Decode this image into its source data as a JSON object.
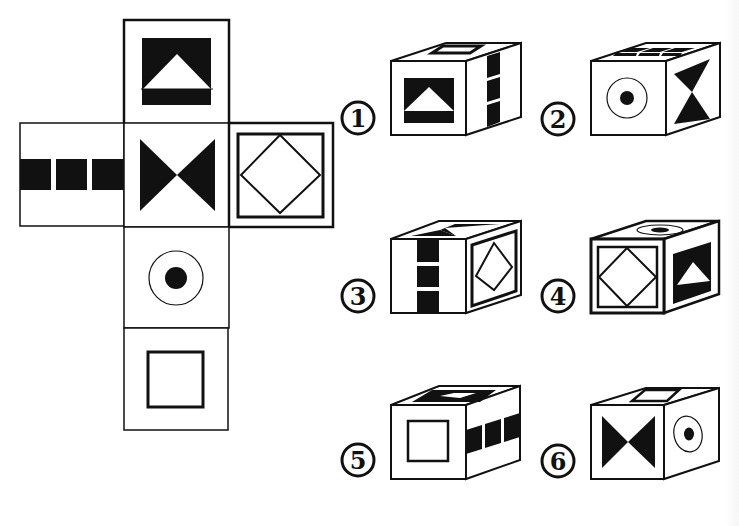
{
  "puzzle": {
    "type": "cube-net-folding",
    "net": {
      "faces": [
        {
          "id": "top",
          "symbol": "white-triangle-on-black-square",
          "position": "row0-col1"
        },
        {
          "id": "left",
          "symbol": "three-black-squares-row",
          "position": "row1-col0"
        },
        {
          "id": "center",
          "symbol": "black-bowtie",
          "position": "row1-col1"
        },
        {
          "id": "right",
          "symbol": "diamond-in-double-frame",
          "position": "row1-col2"
        },
        {
          "id": "below1",
          "symbol": "dot-in-circle",
          "position": "row2-col1"
        },
        {
          "id": "below2",
          "symbol": "hollow-square",
          "position": "row3-col1"
        }
      ]
    },
    "options": [
      {
        "label": "①",
        "number": "1",
        "front": "white-triangle-on-black-square",
        "top": "hollow-square",
        "side": "three-black-squares-column"
      },
      {
        "label": "②",
        "number": "2",
        "front": "dot-in-circle",
        "top": "three-black-squares-row",
        "side": "black-hourglass"
      },
      {
        "label": "③",
        "number": "3",
        "front": "three-black-squares-column",
        "top": "black-bowtie",
        "side": "diamond-in-double-frame"
      },
      {
        "label": "④",
        "number": "4",
        "front": "diamond-in-double-frame",
        "top": "dot-in-circle",
        "side": "white-triangle-on-black-square"
      },
      {
        "label": "⑤",
        "number": "5",
        "front": "hollow-square",
        "top": "white-triangle-on-black-square",
        "side": "three-black-squares-row"
      },
      {
        "label": "⑥",
        "number": "6",
        "front": "black-bowtie",
        "top": "hollow-square",
        "side": "dot-in-circle"
      }
    ]
  },
  "colors": {
    "ink": "#111111",
    "paper": "#ffffff"
  }
}
